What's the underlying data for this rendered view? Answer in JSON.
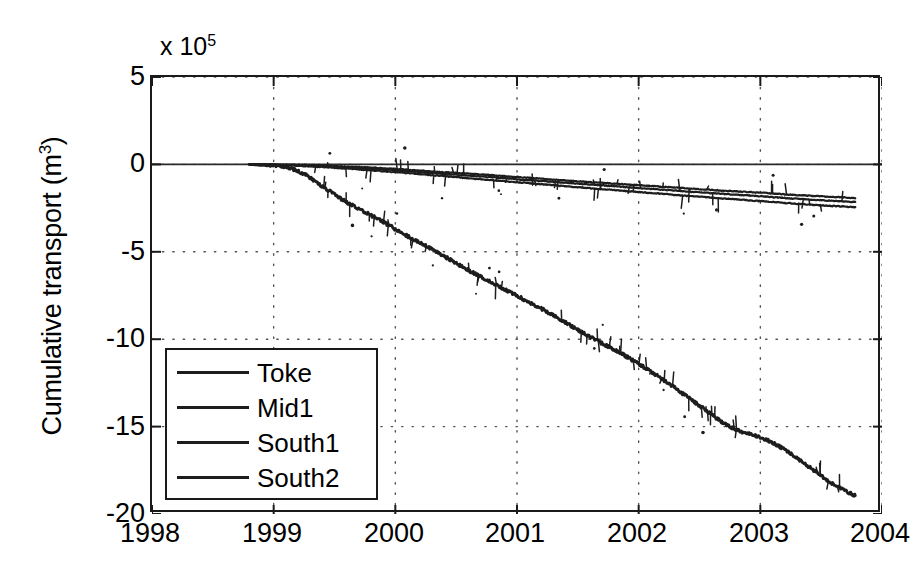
{
  "chart_data": {
    "type": "line",
    "title": "",
    "xlabel": "",
    "ylabel": "Cumulative transport (m3)",
    "ylabel_base": "Cumulative transport (m",
    "ylabel_sup": "3",
    "ylabel_tail": ")",
    "y_multiplier_base": "x 10",
    "y_multiplier_exp": "5",
    "y_multiplier_value": 100000,
    "xlim": [
      1998,
      2004
    ],
    "ylim": [
      -20,
      5
    ],
    "xticks": [
      1998,
      1999,
      2000,
      2001,
      2002,
      2003,
      2004
    ],
    "yticks": [
      5,
      0,
      -5,
      -10,
      -15,
      -20
    ],
    "xtick_labels": [
      "1998",
      "1999",
      "2000",
      "2001",
      "2002",
      "2003",
      "2004"
    ],
    "ytick_labels": [
      "5",
      "0",
      "-5",
      "-10",
      "-15",
      "-20"
    ],
    "grid": true,
    "grid_style": "dotted",
    "legend_position": "lower-left",
    "legend_entries": [
      "Toke",
      "Mid1",
      "South1",
      "South2"
    ],
    "line_color": "#1d1d1d",
    "series": [
      {
        "name": "Toke",
        "color": "#1d1d1d",
        "x": [
          1998.8,
          1999.0,
          1999.2,
          1999.4,
          1999.6,
          1999.8,
          2000.0,
          2000.2,
          2000.4,
          2000.6,
          2000.8,
          2001.0,
          2001.2,
          2001.4,
          2001.6,
          2001.8,
          2002.0,
          2002.2,
          2002.4,
          2002.6,
          2002.8,
          2003.0,
          2003.2,
          2003.4,
          2003.6,
          2003.78
        ],
        "y": [
          0.0,
          -0.01,
          -0.02,
          -0.06,
          -0.12,
          -0.18,
          -0.26,
          -0.35,
          -0.45,
          -0.53,
          -0.62,
          -0.72,
          -0.82,
          -0.92,
          -1.01,
          -1.1,
          -1.19,
          -1.28,
          -1.37,
          -1.46,
          -1.54,
          -1.62,
          -1.71,
          -1.79,
          -1.86,
          -1.92
        ]
      },
      {
        "name": "Mid1",
        "color": "#1d1d1d",
        "x": [
          1998.8,
          1999.0,
          1999.2,
          1999.4,
          1999.6,
          1999.8,
          2000.0,
          2000.2,
          2000.4,
          2000.6,
          2000.8,
          2001.0,
          2001.2,
          2001.4,
          2001.6,
          2001.8,
          2002.0,
          2002.2,
          2002.4,
          2002.6,
          2002.8,
          2003.0,
          2003.2,
          2003.4,
          2003.6,
          2003.78
        ],
        "y": [
          0.0,
          -0.02,
          -0.05,
          -0.1,
          -0.17,
          -0.25,
          -0.34,
          -0.44,
          -0.54,
          -0.64,
          -0.74,
          -0.85,
          -0.95,
          -1.05,
          -1.15,
          -1.25,
          -1.35,
          -1.45,
          -1.55,
          -1.64,
          -1.73,
          -1.82,
          -1.92,
          -2.01,
          -2.09,
          -2.15
        ]
      },
      {
        "name": "South1",
        "color": "#1d1d1d",
        "x": [
          1998.8,
          1999.0,
          1999.2,
          1999.4,
          1999.6,
          1999.8,
          2000.0,
          2000.2,
          2000.4,
          2000.6,
          2000.8,
          2001.0,
          2001.2,
          2001.4,
          2001.6,
          2001.8,
          2002.0,
          2002.2,
          2002.4,
          2002.6,
          2002.8,
          2003.0,
          2003.2,
          2003.4,
          2003.6,
          2003.78
        ],
        "y": [
          0.0,
          -0.03,
          -0.08,
          -0.15,
          -0.24,
          -0.34,
          -0.45,
          -0.56,
          -0.67,
          -0.79,
          -0.9,
          -1.02,
          -1.13,
          -1.25,
          -1.36,
          -1.47,
          -1.58,
          -1.69,
          -1.8,
          -1.9,
          -2.0,
          -2.1,
          -2.2,
          -2.3,
          -2.38,
          -2.45
        ]
      },
      {
        "name": "South2",
        "color": "#1d1d1d",
        "x": [
          1998.8,
          1998.95,
          1999.1,
          1999.25,
          1999.4,
          1999.55,
          1999.7,
          1999.85,
          2000.0,
          2000.15,
          2000.3,
          2000.45,
          2000.6,
          2000.75,
          2000.9,
          2001.05,
          2001.2,
          2001.35,
          2001.5,
          2001.65,
          2001.8,
          2001.95,
          2002.1,
          2002.25,
          2002.4,
          2002.55,
          2002.7,
          2002.85,
          2003.0,
          2003.15,
          2003.3,
          2003.45,
          2003.6,
          2003.78
        ],
        "y": [
          0.0,
          -0.05,
          -0.15,
          -0.55,
          -1.25,
          -1.95,
          -2.55,
          -3.1,
          -3.7,
          -4.3,
          -4.85,
          -5.45,
          -6.05,
          -6.6,
          -7.15,
          -7.7,
          -8.25,
          -8.85,
          -9.45,
          -10.05,
          -10.6,
          -11.2,
          -11.85,
          -12.55,
          -13.3,
          -14.05,
          -14.8,
          -15.3,
          -15.6,
          -16.1,
          -16.8,
          -17.55,
          -18.3,
          -18.95
        ]
      }
    ]
  },
  "axes": {
    "frame_color": "#1a1a1a",
    "tick_color": "#1a1a1a",
    "grid_color": "#555555",
    "background": "#ffffff"
  }
}
